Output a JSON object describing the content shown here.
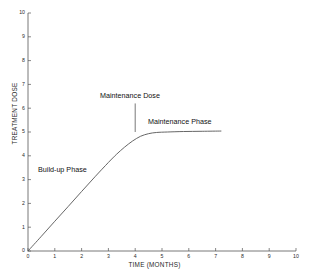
{
  "chart_data": {
    "type": "line",
    "title": "",
    "xlabel": "TIME (MONTHS)",
    "ylabel": "TREATMENT DOSE",
    "xlim": [
      0,
      10
    ],
    "ylim": [
      0,
      10
    ],
    "xticks": [
      "0",
      "1",
      "2",
      "3",
      "4",
      "5",
      "6",
      "7",
      "8",
      "9",
      "10"
    ],
    "yticks": [
      "0",
      "1",
      "2",
      "3",
      "4",
      "5",
      "6",
      "7",
      "8",
      "9",
      "10"
    ],
    "grid": false,
    "legend": "none",
    "series": [
      {
        "name": "Treatment dose over time",
        "x": [
          0,
          0.5,
          1.0,
          1.5,
          2.0,
          2.5,
          3.0,
          3.3,
          3.6,
          3.9,
          4.2,
          4.5,
          4.8,
          5.2,
          5.8,
          6.5,
          7.2
        ],
        "y": [
          0,
          0.62,
          1.25,
          1.87,
          2.5,
          3.12,
          3.72,
          4.06,
          4.36,
          4.62,
          4.82,
          4.93,
          4.98,
          5.0,
          5.02,
          5.03,
          5.04
        ]
      }
    ],
    "annotations": [
      {
        "name": "maintenance-dose",
        "text": "Maintenance Dose",
        "pointer_x": 4.0,
        "pointer_y_top": 6.2,
        "pointer_y_bottom": 5.0
      },
      {
        "name": "maintenance-phase",
        "text": "Maintenance Phase",
        "x": 5.6,
        "y": 5.5
      },
      {
        "name": "buildup-phase",
        "text": "Build-up Phase",
        "x": 1.6,
        "y": 3.4
      }
    ],
    "colors": {
      "background": "#ffffff",
      "axis": "#555555",
      "curve": "#555555",
      "text": "#1a1a1a"
    }
  },
  "axes": {
    "x_title": "TIME (MONTHS)",
    "y_title": "TREATMENT DOSE"
  }
}
